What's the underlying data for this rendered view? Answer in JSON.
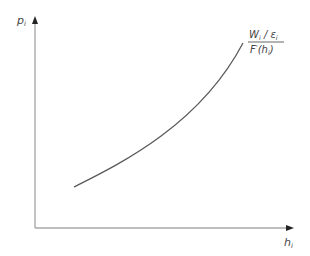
{
  "diagram": {
    "type": "supply-curve",
    "y_axis_label": {
      "main": "p",
      "sub": "i"
    },
    "x_axis_label": {
      "main": "h",
      "sub": "i"
    },
    "curve_label": {
      "numerator": {
        "w": "W",
        "w_sub": "i",
        "slash": " / ",
        "eps": "ε",
        "eps_sub": "i"
      },
      "denominator": {
        "f": "F",
        "prime": "'",
        "open": "(",
        "h": "h",
        "h_sub": "i",
        "close": ")"
      }
    },
    "colors": {
      "axis": "#a8a8a8",
      "arrow": "#222222",
      "curve": "#5a5a5a",
      "text": "#444444"
    },
    "geometry": {
      "origin": [
        35,
        228
      ],
      "y_axis_top": [
        35,
        18
      ],
      "x_axis_right": [
        292,
        228
      ],
      "curve_path": "M74,187 C120,164 200,125 243,43"
    }
  }
}
